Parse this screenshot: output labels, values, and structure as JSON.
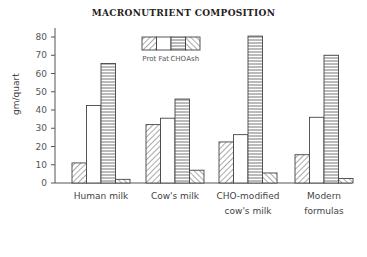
{
  "chart_data": {
    "type": "bar",
    "title": "MACRONUTRIENT COMPOSITION",
    "xlabel": "",
    "ylabel": "gm/quart",
    "ylim": [
      0,
      85
    ],
    "yticks": [
      0,
      10,
      20,
      30,
      40,
      50,
      60,
      70,
      80
    ],
    "grid": false,
    "legend_position": "top-center",
    "categories": [
      "Human milk",
      "Cow's milk",
      "CHO-modified cow's milk",
      "Modern formulas"
    ],
    "category_label_lines": [
      [
        "Human milk"
      ],
      [
        "Cow's milk"
      ],
      [
        "CHO-modified",
        "cow's milk"
      ],
      [
        "Modern",
        "formulas"
      ]
    ],
    "series": [
      {
        "name": "Prot",
        "pattern": "diagonal-forward",
        "values": [
          11,
          32,
          22.5,
          15.5
        ]
      },
      {
        "name": "Fat",
        "pattern": "blank",
        "values": [
          42.5,
          35.5,
          26.5,
          36
        ]
      },
      {
        "name": "CHO",
        "pattern": "horizontal-lines",
        "values": [
          65.5,
          46,
          80.5,
          70
        ]
      },
      {
        "name": "Ash",
        "pattern": "diagonal-back",
        "values": [
          2,
          7,
          5.5,
          2.5
        ]
      }
    ]
  }
}
